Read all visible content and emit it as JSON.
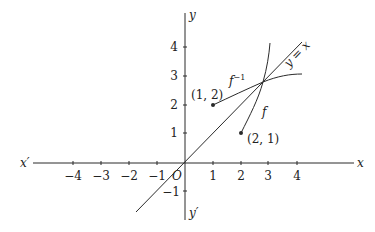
{
  "diagram": {
    "axes": {
      "x_pos_label": "x",
      "x_neg_label": "x′",
      "y_pos_label": "y",
      "y_neg_label": "y′",
      "origin_label": "O",
      "x_ticks": [
        "−4",
        "−3",
        "−2",
        "−1",
        "1",
        "2",
        "3",
        "4"
      ],
      "y_ticks": [
        "4",
        "3",
        "2",
        "1",
        "−1"
      ]
    },
    "curves": {
      "f_label": "f",
      "f_inverse_label_base": "f",
      "f_inverse_label_sup": "−1",
      "diagonal_label": "y = x"
    },
    "points": [
      {
        "label": "(1, 2)",
        "x": 1,
        "y": 2
      },
      {
        "label": "(2, 1)",
        "x": 2,
        "y": 1
      }
    ],
    "colors": {
      "line": "#2a2a2a",
      "background": "#ffffff"
    }
  }
}
